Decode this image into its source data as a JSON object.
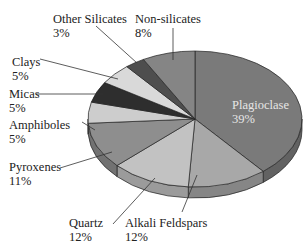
{
  "chart_data": {
    "type": "pie",
    "style": "3d-tilted",
    "title": "",
    "start_angle": "12 o'clock, clockwise",
    "categories": [
      "Plagioclase",
      "Alkali Feldspars",
      "Quartz",
      "Pyroxenes",
      "Amphiboles",
      "Micas",
      "Clays",
      "Other Silicates",
      "Non-silicates"
    ],
    "values": [
      39,
      12,
      12,
      11,
      5,
      5,
      5,
      3,
      8
    ],
    "unit": "%",
    "colors": [
      "#7a7a7a",
      "#a8a8a8",
      "#c2c2c2",
      "#8e8e8e",
      "#cdcdcd",
      "#2e2e2e",
      "#d9d9d9",
      "#4e4e4e",
      "#858585"
    ],
    "legend": "none (leader-line labels)"
  },
  "labels": [
    {
      "name": "Plagioclase",
      "pct": "39%"
    },
    {
      "name": "Alkali Feldspars",
      "pct": "12%"
    },
    {
      "name": "Quartz",
      "pct": "12%"
    },
    {
      "name": "Pyroxenes",
      "pct": "11%"
    },
    {
      "name": "Amphiboles",
      "pct": "5%"
    },
    {
      "name": "Micas",
      "pct": "5%"
    },
    {
      "name": "Clays",
      "pct": "5%"
    },
    {
      "name": "Other Silicates",
      "pct": "3%"
    },
    {
      "name": "Non-silicates",
      "pct": "8%"
    }
  ]
}
